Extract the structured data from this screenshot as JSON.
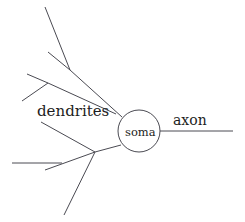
{
  "diagram": {
    "type": "neuron-schematic",
    "title": "",
    "background_color": "#ffffff",
    "stroke_color": "#4a4a52",
    "text_color": "#1d1d22",
    "labels": {
      "dendrites": "dendrites",
      "soma": "soma",
      "axon": "axon"
    },
    "label_positions": {
      "dendrites": {
        "x": 37,
        "y": 116
      },
      "soma": {
        "x": 125,
        "y": 136
      },
      "axon": {
        "x": 173,
        "y": 125
      }
    },
    "soma": {
      "shape": "ellipse",
      "cx": 139,
      "cy": 131,
      "rx": 21,
      "ry": 21
    },
    "axon": {
      "x1": 160,
      "y1": 131,
      "x2": 233,
      "y2": 131
    },
    "dendrite_branches": [
      {
        "name": "upper-trunk",
        "x1": 122,
        "y1": 117,
        "x2": 70,
        "y2": 70
      },
      {
        "name": "upper-trunk-upper",
        "x1": 70,
        "y1": 70,
        "x2": 45,
        "y2": 7
      },
      {
        "name": "upper-trunk-side",
        "x1": 70,
        "y1": 70,
        "x2": 48,
        "y2": 52
      },
      {
        "name": "upper-mid-trunk",
        "x1": 116,
        "y1": 114,
        "x2": 48,
        "y2": 83
      },
      {
        "name": "upper-mid-up",
        "x1": 48,
        "y1": 83,
        "x2": 27,
        "y2": 74
      },
      {
        "name": "upper-mid-down",
        "x1": 48,
        "y1": 83,
        "x2": 22,
        "y2": 101
      },
      {
        "name": "lower-trunk",
        "x1": 121,
        "y1": 145,
        "x2": 95,
        "y2": 152
      },
      {
        "name": "lower-branch-upleft",
        "x1": 95,
        "y1": 152,
        "x2": 41,
        "y2": 122
      },
      {
        "name": "lower-branch-mid",
        "x1": 95,
        "y1": 152,
        "x2": 45,
        "y2": 170
      },
      {
        "name": "lower-branch-horiz",
        "x1": 62,
        "y1": 163,
        "x2": 12,
        "y2": 163
      },
      {
        "name": "lower-branch-down",
        "x1": 95,
        "y1": 152,
        "x2": 64,
        "y2": 215
      }
    ]
  }
}
